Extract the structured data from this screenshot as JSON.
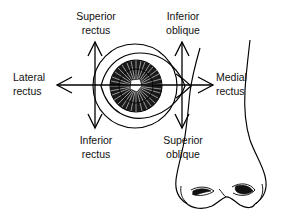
{
  "figure": {
    "background_color": "#ffffff",
    "stroke_color": "#000000",
    "text_color": "#111111"
  },
  "labels": {
    "superior_rectus": {
      "line1": "Superior",
      "line2": "rectus"
    },
    "inferior_oblique": {
      "line1": "Inferior",
      "line2": "oblique"
    },
    "lateral_rectus": {
      "line1": "Lateral",
      "line2": "rectus"
    },
    "medial_rectus": {
      "line1": "Medial",
      "line2": "rectus"
    },
    "inferior_rectus": {
      "line1": "Inferior",
      "line2": "rectus"
    },
    "superior_oblique": {
      "line1": "Superior",
      "line2": "oblique"
    }
  },
  "anatomy": {
    "eye": "eye-globe-with-iris-and-pupil",
    "nose": "nose-outline-with-nostrils"
  },
  "arrows": [
    {
      "name": "superior-rectus-arrow",
      "direction": "up",
      "x": 95,
      "from_y": 85,
      "to_y": 42
    },
    {
      "name": "inferior-rectus-arrow",
      "direction": "down",
      "x": 95,
      "from_y": 85,
      "to_y": 128
    },
    {
      "name": "inferior-oblique-arrow",
      "direction": "up",
      "x": 182,
      "from_y": 85,
      "to_y": 42
    },
    {
      "name": "superior-oblique-arrow",
      "direction": "down",
      "x": 182,
      "from_y": 85,
      "to_y": 128
    },
    {
      "name": "lateral-rectus-arrow",
      "direction": "left",
      "y": 85,
      "from_x": 182,
      "to_x": 57
    },
    {
      "name": "medial-rectus-arrow",
      "direction": "right",
      "y": 85,
      "from_x": 95,
      "to_x": 213
    }
  ]
}
